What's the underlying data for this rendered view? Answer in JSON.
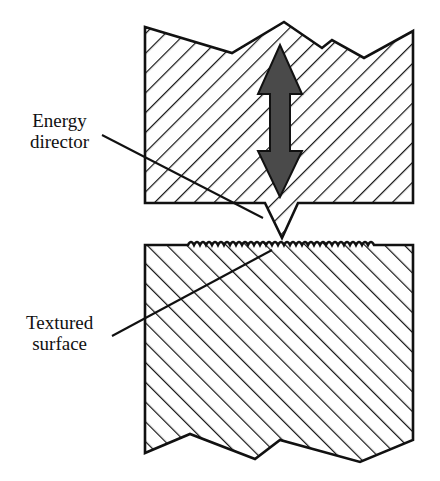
{
  "diagram": {
    "type": "cross-section",
    "colors": {
      "outline": "#111111",
      "hatch": "#111111",
      "arrow_fill": "#4a4a4a",
      "background": "#ffffff"
    },
    "parts": {
      "upper_part": {
        "hatch_direction": "forward-slash",
        "has_energy_director": true
      },
      "lower_part": {
        "hatch_direction": "back-slash",
        "has_textured_surface": true
      },
      "arrow": {
        "type": "double-headed-vertical",
        "meaning": "vibration direction"
      }
    },
    "labels": {
      "energy_director": {
        "line1": "Energy",
        "line2": "director"
      },
      "textured_surface": {
        "line1": "Textured",
        "line2": "surface"
      }
    }
  }
}
